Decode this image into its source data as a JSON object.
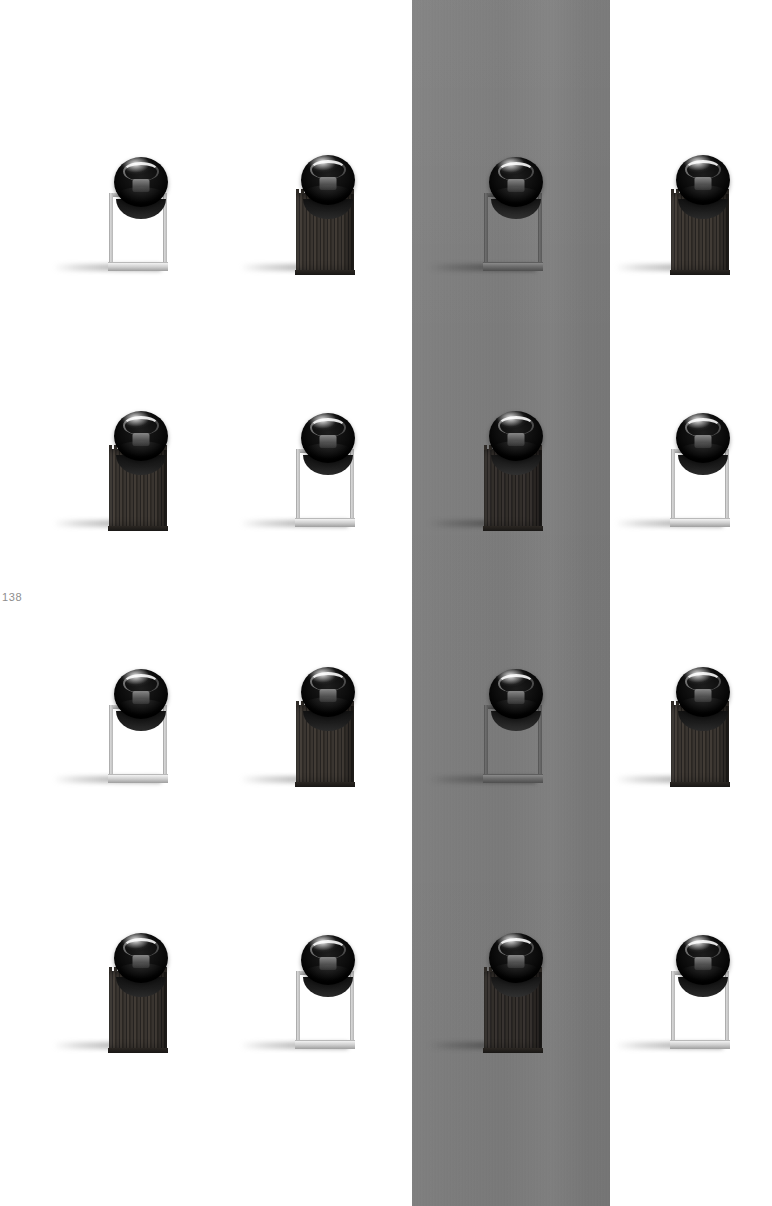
{
  "page": {
    "number": "138",
    "background_color": "#ffffff",
    "width": 772,
    "height": 1206
  },
  "gray_band": {
    "label": "gray-vertical-band",
    "color": "#7c7c7c",
    "x": 412,
    "y": 0,
    "width": 198,
    "height": 1206,
    "covers_column": 3
  },
  "grid": {
    "rows": 4,
    "columns": 4,
    "column_centers": [
      141,
      328,
      516,
      703
    ],
    "row_bottoms": [
      277,
      533,
      789,
      1055
    ]
  },
  "product": {
    "name": "orb-on-stand",
    "orb_color": "#0c0c0c",
    "frame_color": "#c8c8c8",
    "wood_color": "#2f2b27"
  },
  "items": [
    {
      "id": "r1c1",
      "row": 1,
      "col": 1,
      "base": "frame",
      "background": "white",
      "label": "frame-base-white"
    },
    {
      "id": "r1c2",
      "row": 1,
      "col": 2,
      "base": "wood",
      "background": "white",
      "label": "wood-base-white"
    },
    {
      "id": "r1c3",
      "row": 1,
      "col": 3,
      "base": "frame",
      "background": "gray",
      "label": "frame-base-gray"
    },
    {
      "id": "r1c4",
      "row": 1,
      "col": 4,
      "base": "wood",
      "background": "white",
      "label": "wood-base-white"
    },
    {
      "id": "r2c1",
      "row": 2,
      "col": 1,
      "base": "wood",
      "background": "white",
      "label": "wood-base-white"
    },
    {
      "id": "r2c2",
      "row": 2,
      "col": 2,
      "base": "frame",
      "background": "white",
      "label": "frame-base-white"
    },
    {
      "id": "r2c3",
      "row": 2,
      "col": 3,
      "base": "wood",
      "background": "gray",
      "label": "wood-base-gray"
    },
    {
      "id": "r2c4",
      "row": 2,
      "col": 4,
      "base": "frame",
      "background": "white",
      "label": "frame-base-white"
    },
    {
      "id": "r3c1",
      "row": 3,
      "col": 1,
      "base": "frame",
      "background": "white",
      "label": "frame-base-white"
    },
    {
      "id": "r3c2",
      "row": 3,
      "col": 2,
      "base": "wood",
      "background": "white",
      "label": "wood-base-white"
    },
    {
      "id": "r3c3",
      "row": 3,
      "col": 3,
      "base": "frame",
      "background": "gray",
      "label": "frame-base-gray"
    },
    {
      "id": "r3c4",
      "row": 3,
      "col": 4,
      "base": "wood",
      "background": "white",
      "label": "wood-base-white"
    },
    {
      "id": "r4c1",
      "row": 4,
      "col": 1,
      "base": "wood",
      "background": "white",
      "label": "wood-base-white"
    },
    {
      "id": "r4c2",
      "row": 4,
      "col": 2,
      "base": "frame",
      "background": "white",
      "label": "frame-base-white"
    },
    {
      "id": "r4c3",
      "row": 4,
      "col": 3,
      "base": "wood",
      "background": "gray",
      "label": "wood-base-gray"
    },
    {
      "id": "r4c4",
      "row": 4,
      "col": 4,
      "base": "frame",
      "background": "white",
      "label": "frame-base-white"
    }
  ]
}
